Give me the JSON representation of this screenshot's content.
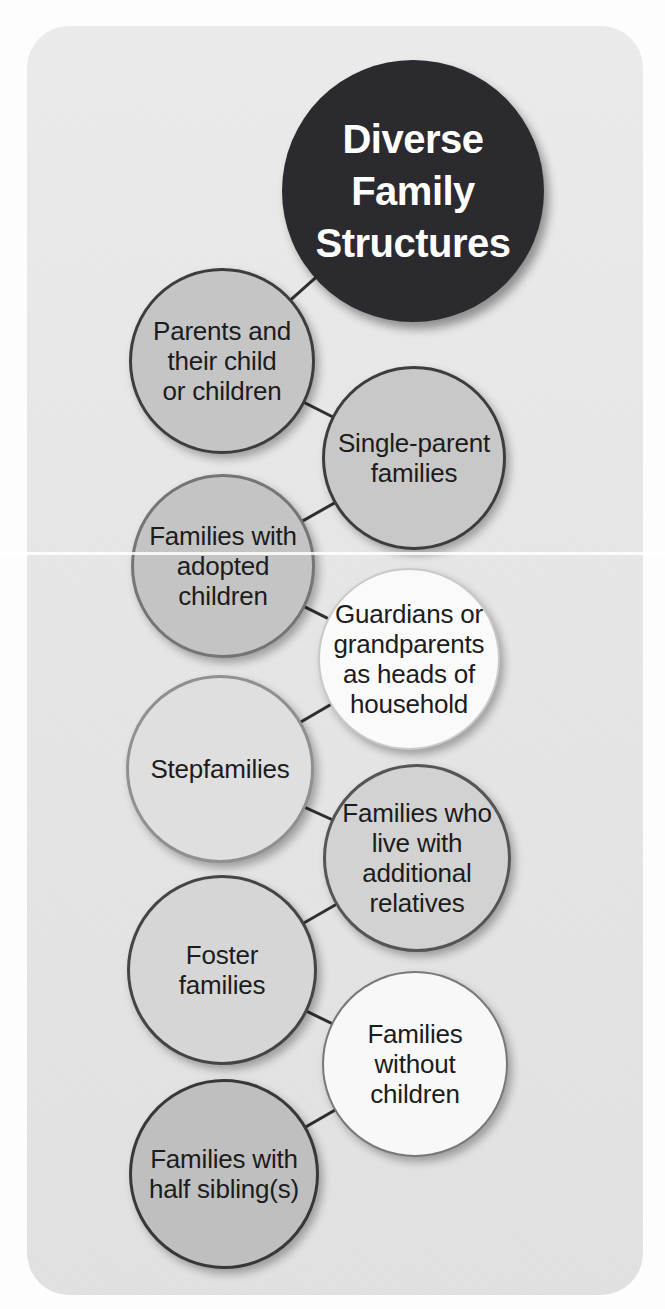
{
  "diagram": {
    "title": "Diverse Family Structures",
    "connector_color": "#2f2f2f",
    "nodes": [
      {
        "id": "diverse-family-structures",
        "role": "root",
        "label": "Diverse\nFamily\nStructures",
        "fill": "#2b2a2e",
        "stroke": "#2b2a2e",
        "stroke_width": 0,
        "text_color": "#ffffff"
      },
      {
        "id": "parents-and-their-children",
        "label": "Parents and\ntheir child\nor children",
        "fill": "#c5c5c5",
        "stroke": "#3d3d3d",
        "stroke_width": 3,
        "text_color": "#1c1c1c"
      },
      {
        "id": "single-parent-families",
        "label": "Single-parent\nfamilies",
        "fill": "#c8c8c8",
        "stroke": "#3d3d3d",
        "stroke_width": 3,
        "text_color": "#1c1c1c"
      },
      {
        "id": "families-with-adopted-children",
        "label": "Families with\nadopted\nchildren",
        "fill": "#c4c4c4",
        "stroke": "#757575",
        "stroke_width": 3,
        "text_color": "#1c1c1c"
      },
      {
        "id": "guardians-or-grandparents-heads-of-household",
        "label": "Guardians or\ngrandparents\nas heads of\nhousehold",
        "fill": "#fafafa",
        "stroke": "#c9c9c9",
        "stroke_width": 2,
        "text_color": "#1c1c1c"
      },
      {
        "id": "stepfamilies",
        "label": "Stepfamilies",
        "fill": "#dfdfdf",
        "stroke": "#909090",
        "stroke_width": 3,
        "text_color": "#1c1c1c"
      },
      {
        "id": "families-with-additional-relatives",
        "label": "Families who\nlive with\nadditional\nrelatives",
        "fill": "#d2d2d2",
        "stroke": "#555555",
        "stroke_width": 3,
        "text_color": "#1c1c1c"
      },
      {
        "id": "foster-families",
        "label": "Foster\nfamilies",
        "fill": "#d6d6d6",
        "stroke": "#454545",
        "stroke_width": 3,
        "text_color": "#1c1c1c"
      },
      {
        "id": "families-without-children",
        "label": "Families\nwithout\nchildren",
        "fill": "#f8f8f8",
        "stroke": "#787878",
        "stroke_width": 2,
        "text_color": "#1c1c1c"
      },
      {
        "id": "families-with-half-siblings",
        "label": "Families with\nhalf sibling(s)",
        "fill": "#bfbfbf",
        "stroke": "#383838",
        "stroke_width": 3,
        "text_color": "#1c1c1c"
      }
    ],
    "connections": [
      [
        0,
        1
      ],
      [
        1,
        2
      ],
      [
        2,
        3
      ],
      [
        3,
        4
      ],
      [
        4,
        5
      ],
      [
        5,
        6
      ],
      [
        6,
        7
      ],
      [
        7,
        8
      ],
      [
        8,
        9
      ]
    ]
  },
  "colors": {
    "page_background": "#fdfdfd",
    "panel_background": "#e6e6e6",
    "title_circle": "#2b2a2e",
    "title_text": "#ffffff",
    "body_text": "#1c1c1c",
    "connector": "#2f2f2f"
  }
}
